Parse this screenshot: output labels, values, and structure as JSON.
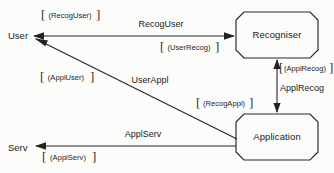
{
  "diagram": {
    "background_color": "#fcfcfa",
    "line_color": "#262626",
    "text_color": "#1b1b1b",
    "nodes": [
      {
        "id": "user",
        "label": "User",
        "shape": "text-endpoint"
      },
      {
        "id": "recogniser",
        "label": "Recogniser",
        "shape": "octagon-box"
      },
      {
        "id": "application",
        "label": "Application",
        "shape": "octagon-box"
      },
      {
        "id": "serv",
        "label": "Serv",
        "shape": "text-endpoint"
      }
    ],
    "edges": [
      {
        "id": "user-to-recogniser",
        "from": "user",
        "to": "recogniser",
        "direction": "bidirectional",
        "label_above": "RecogUser",
        "label_bracket_start": "(RecogUser)",
        "label_bracket_end": "(UserRecog)"
      },
      {
        "id": "application-to-user",
        "from": "application",
        "to": "user",
        "direction": "to-user",
        "label_on_line": "UserAppl",
        "label_bracket": "(ApplUser)"
      },
      {
        "id": "recogniser-to-application",
        "from": "recogniser",
        "to": "application",
        "direction": "bidirectional",
        "label_side": "ApplRecog",
        "label_bracket_top": "(ApplRecog)",
        "label_bracket_bottom": "(RecogAppl)"
      },
      {
        "id": "application-to-serv",
        "from": "application",
        "to": "serv",
        "direction": "to-serv",
        "label_above": "ApplServ",
        "label_bracket": "(ApplServ)"
      }
    ]
  }
}
